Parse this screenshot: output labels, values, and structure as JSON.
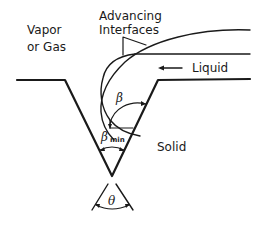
{
  "diagram": {
    "type": "schematic",
    "labels": {
      "vapor_line1": "Vapor",
      "vapor_line2": "or Gas",
      "advancing_line1": "Advancing",
      "advancing_line2": "Interfaces",
      "liquid": "Liquid",
      "solid": "Solid"
    },
    "angles": {
      "beta": "β",
      "beta_min": "β",
      "beta_min_subscript": "min",
      "theta": "θ"
    },
    "colors": {
      "stroke": "#1a1a1a",
      "background": "#ffffff"
    }
  }
}
